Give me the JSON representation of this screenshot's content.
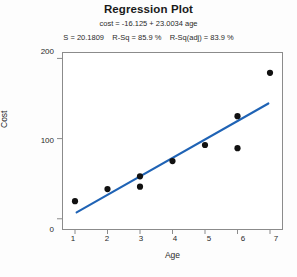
{
  "chart_data": {
    "type": "scatter",
    "title": "Regression Plot",
    "equation": "cost = -16.125 + 23.0034 age",
    "stats": "S = 20.1809    R-Sq = 85.9 %    R-Sq(adj) = 83.9 %",
    "stat_values": {
      "S": "20.1809",
      "R_Sq": "85.9 %",
      "R_Sq_adj": "83.9 %",
      "intercept": -16.125,
      "slope": 23.0034
    },
    "xlabel": "Age",
    "ylabel": "Cost",
    "xlim": [
      0.6,
      7.4
    ],
    "ylim": [
      -14,
      208
    ],
    "xticks": [
      "1",
      "2",
      "3",
      "4",
      "5",
      "6",
      "7"
    ],
    "xtick_values": [
      1,
      2,
      3,
      4,
      5,
      6,
      7
    ],
    "yticks": [
      "0",
      "100",
      "200"
    ],
    "ytick_values": [
      0,
      100,
      200
    ],
    "grid": false,
    "legend": "none",
    "marker_color": "#111111",
    "line_color": "#1f63b5",
    "frame_color": "#8b8b8b",
    "points": [
      {
        "x": 1,
        "y": 22
      },
      {
        "x": 2,
        "y": 37
      },
      {
        "x": 3,
        "y": 40
      },
      {
        "x": 3,
        "y": 53
      },
      {
        "x": 4,
        "y": 72
      },
      {
        "x": 5,
        "y": 92
      },
      {
        "x": 6,
        "y": 88
      },
      {
        "x": 6,
        "y": 128
      },
      {
        "x": 7,
        "y": 182
      }
    ],
    "fit_line": {
      "x_start": 1.05,
      "y_start": 8.0,
      "x_end": 6.95,
      "y_end": 143.8
    }
  }
}
